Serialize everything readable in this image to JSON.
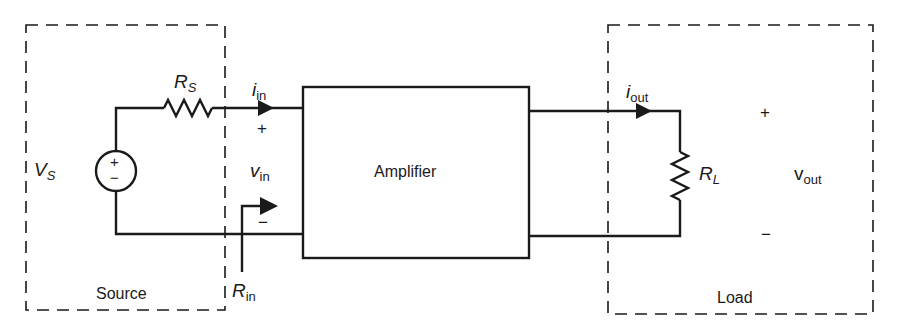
{
  "diagram": {
    "source": {
      "box_label": "Source",
      "voltage_label": {
        "main": "V",
        "sub": "S"
      },
      "resistor_label": {
        "main": "R",
        "sub": "S"
      },
      "source_plus": "+",
      "source_minus": "−"
    },
    "input": {
      "current_label": {
        "main": "i",
        "sub": "in"
      },
      "voltage_label": {
        "main": "v",
        "sub": "in"
      },
      "plus": "+",
      "minus": "−",
      "resistance_label": {
        "main": "R",
        "sub": "in"
      }
    },
    "amplifier": {
      "label": "Amplifier"
    },
    "output": {
      "current_label": {
        "main": "i",
        "sub": "out"
      }
    },
    "load": {
      "box_label": "Load",
      "resistor_label": {
        "main": "R",
        "sub": "L"
      },
      "voltage_label": {
        "main": "v",
        "sub": "out"
      },
      "plus": "+",
      "minus": "−"
    },
    "colors": {
      "stroke": "#1a1a1a",
      "background": "#ffffff"
    }
  }
}
